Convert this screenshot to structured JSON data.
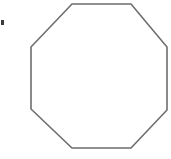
{
  "figure": {
    "name": "octagon",
    "shape_label": "Regular octagon outline",
    "alt_text": "A regular octagon drawn as a thin gray outline on a white background",
    "sides": 8,
    "fill_color": "#ffffff",
    "stroke_color": "#6e6e6e",
    "stroke_width": 1.6,
    "background_color": "#ffffff",
    "canvas": {
      "width": 171,
      "height": 159
    },
    "vertices": [
      {
        "label": "top-left",
        "x": 72,
        "y": 4
      },
      {
        "label": "top-right",
        "x": 131,
        "y": 4
      },
      {
        "label": "right-upper",
        "x": 167,
        "y": 47
      },
      {
        "label": "right-lower",
        "x": 167,
        "y": 110
      },
      {
        "label": "bottom-right",
        "x": 131,
        "y": 148
      },
      {
        "label": "bottom-left",
        "x": 72,
        "y": 148
      },
      {
        "label": "left-lower",
        "x": 31,
        "y": 109
      },
      {
        "label": "left-upper",
        "x": 31,
        "y": 47
      }
    ],
    "edges": [
      {
        "label": "top-edge",
        "orientation": "horizontal"
      },
      {
        "label": "upper-right-diagonal",
        "orientation": "diagonal"
      },
      {
        "label": "right-edge",
        "orientation": "vertical"
      },
      {
        "label": "lower-right-diagonal",
        "orientation": "diagonal"
      },
      {
        "label": "bottom-edge",
        "orientation": "horizontal"
      },
      {
        "label": "lower-left-diagonal",
        "orientation": "diagonal"
      },
      {
        "label": "left-edge",
        "orientation": "vertical"
      },
      {
        "label": "upper-left-diagonal",
        "orientation": "diagonal"
      }
    ]
  },
  "artifacts": {
    "speck": {
      "label": "scan-speck",
      "x": 1,
      "y": 20,
      "width": 3,
      "height": 5,
      "color": "#3a3a3a"
    }
  }
}
